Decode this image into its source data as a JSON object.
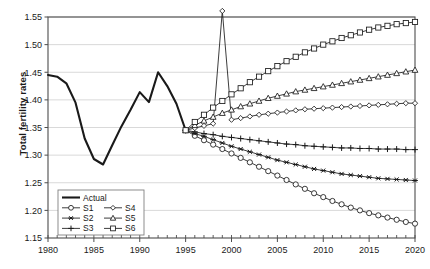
{
  "chart_data": {
    "type": "line",
    "title": "",
    "xlabel": "",
    "ylabel": "Total fertility rates",
    "xlim": [
      1980,
      2020
    ],
    "ylim": [
      1.15,
      1.55
    ],
    "yticks": [
      "1.15",
      "1.20",
      "1.25",
      "1.30",
      "1.35",
      "1.40",
      "1.45",
      "1.50",
      "1.55"
    ],
    "ytick_values": [
      1.15,
      1.2,
      1.25,
      1.3,
      1.35,
      1.4,
      1.45,
      1.5,
      1.55
    ],
    "xticks": [
      "1980",
      "1985",
      "1990",
      "1995",
      "2000",
      "2005",
      "2010",
      "2015",
      "2020"
    ],
    "xtick_values": [
      1980,
      1985,
      1990,
      1995,
      2000,
      2005,
      2010,
      2015,
      2020
    ],
    "x_minor_tick_step": 1,
    "grid": "horizontal",
    "legend_position": "lower-left-inside",
    "series": [
      {
        "name": "Actual",
        "marker": "none",
        "line": "thick-solid",
        "x": [
          1980,
          1981,
          1982,
          1983,
          1984,
          1985,
          1986,
          1987,
          1988,
          1989,
          1990,
          1991,
          1992,
          1993,
          1994,
          1995
        ],
        "values": [
          1.445,
          1.442,
          1.43,
          1.395,
          1.33,
          1.293,
          1.283,
          1.318,
          1.352,
          1.382,
          1.414,
          1.396,
          1.45,
          1.425,
          1.393,
          1.345
        ]
      },
      {
        "name": "S1",
        "marker": "circle",
        "line": "thin-solid",
        "x": [
          1995,
          1996,
          1997,
          1998,
          1999,
          2000,
          2001,
          2002,
          2003,
          2004,
          2005,
          2006,
          2007,
          2008,
          2009,
          2010,
          2011,
          2012,
          2013,
          2014,
          2015,
          2016,
          2017,
          2018,
          2019,
          2020
        ],
        "values": [
          1.345,
          1.335,
          1.327,
          1.319,
          1.311,
          1.303,
          1.295,
          1.287,
          1.279,
          1.271,
          1.263,
          1.255,
          1.247,
          1.239,
          1.231,
          1.224,
          1.217,
          1.211,
          1.205,
          1.2,
          1.195,
          1.191,
          1.187,
          1.183,
          1.179,
          1.176
        ]
      },
      {
        "name": "S2",
        "marker": "asterisk",
        "line": "thin-solid",
        "x": [
          1995,
          1996,
          1997,
          1998,
          1999,
          2000,
          2001,
          2002,
          2003,
          2004,
          2005,
          2006,
          2007,
          2008,
          2009,
          2010,
          2011,
          2012,
          2013,
          2014,
          2015,
          2016,
          2017,
          2018,
          2019,
          2020
        ],
        "values": [
          1.345,
          1.339,
          1.334,
          1.328,
          1.322,
          1.316,
          1.311,
          1.306,
          1.301,
          1.296,
          1.291,
          1.287,
          1.283,
          1.279,
          1.275,
          1.272,
          1.269,
          1.266,
          1.264,
          1.262,
          1.26,
          1.258,
          1.257,
          1.256,
          1.255,
          1.254
        ]
      },
      {
        "name": "S3",
        "marker": "plus",
        "line": "thin-solid",
        "x": [
          1995,
          1996,
          1997,
          1998,
          1999,
          2000,
          2001,
          2002,
          2003,
          2004,
          2005,
          2006,
          2007,
          2008,
          2009,
          2010,
          2011,
          2012,
          2013,
          2014,
          2015,
          2016,
          2017,
          2018,
          2019,
          2020
        ],
        "values": [
          1.345,
          1.342,
          1.339,
          1.337,
          1.334,
          1.332,
          1.33,
          1.328,
          1.326,
          1.324,
          1.322,
          1.32,
          1.319,
          1.317,
          1.316,
          1.315,
          1.314,
          1.313,
          1.313,
          1.312,
          1.312,
          1.311,
          1.311,
          1.311,
          1.31,
          1.31
        ]
      },
      {
        "name": "S4",
        "marker": "diamond",
        "line": "thin-solid",
        "x": [
          1995,
          1996,
          1997,
          1998,
          1999,
          2000,
          2001,
          2002,
          2003,
          2004,
          2005,
          2006,
          2007,
          2008,
          2009,
          2010,
          2011,
          2012,
          2013,
          2014,
          2015,
          2016,
          2017,
          2018,
          2019,
          2020
        ],
        "values": [
          1.345,
          1.349,
          1.353,
          1.357,
          1.561,
          1.364,
          1.367,
          1.37,
          1.373,
          1.375,
          1.377,
          1.379,
          1.381,
          1.383,
          1.384,
          1.385,
          1.386,
          1.387,
          1.388,
          1.389,
          1.39,
          1.391,
          1.392,
          1.393,
          1.394,
          1.394
        ]
      },
      {
        "name": "S5",
        "marker": "triangle",
        "line": "thin-solid",
        "x": [
          1995,
          1996,
          1997,
          1998,
          1999,
          2000,
          2001,
          2002,
          2003,
          2004,
          2005,
          2006,
          2007,
          2008,
          2009,
          2010,
          2011,
          2012,
          2013,
          2014,
          2015,
          2016,
          2017,
          2018,
          2019,
          2020
        ],
        "values": [
          1.345,
          1.354,
          1.362,
          1.369,
          1.376,
          1.382,
          1.388,
          1.393,
          1.398,
          1.403,
          1.407,
          1.411,
          1.415,
          1.418,
          1.421,
          1.424,
          1.427,
          1.43,
          1.433,
          1.436,
          1.439,
          1.442,
          1.445,
          1.448,
          1.451,
          1.454
        ]
      },
      {
        "name": "S6",
        "marker": "square",
        "line": "thin-solid",
        "x": [
          1995,
          1996,
          1997,
          1998,
          1999,
          2000,
          2001,
          2002,
          2003,
          2004,
          2005,
          2006,
          2007,
          2008,
          2009,
          2010,
          2011,
          2012,
          2013,
          2014,
          2015,
          2016,
          2017,
          2018,
          2019,
          2020
        ],
        "values": [
          1.345,
          1.36,
          1.373,
          1.386,
          1.398,
          1.41,
          1.421,
          1.432,
          1.442,
          1.452,
          1.461,
          1.47,
          1.478,
          1.486,
          1.493,
          1.5,
          1.506,
          1.512,
          1.517,
          1.522,
          1.527,
          1.531,
          1.534,
          1.537,
          1.539,
          1.541
        ]
      }
    ],
    "legend": [
      {
        "label": "Actual",
        "marker": "none"
      },
      {
        "label": "S1",
        "marker": "circle"
      },
      {
        "label": "S4",
        "marker": "diamond"
      },
      {
        "label": "S2",
        "marker": "asterisk"
      },
      {
        "label": "S5",
        "marker": "triangle"
      },
      {
        "label": "S3",
        "marker": "plus"
      },
      {
        "label": "S6",
        "marker": "square"
      }
    ]
  },
  "colors": {
    "line": "#1a1a1a",
    "grid": "#d9d9d9",
    "frame": "#4d4d4d",
    "background": "#ffffff"
  }
}
